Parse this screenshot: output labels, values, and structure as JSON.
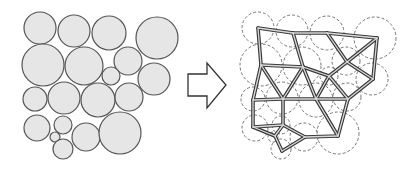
{
  "colors": {
    "background": "#ffffff",
    "circle_fill": "#e6e6e6",
    "circle_stroke": "#555555",
    "dashed_stroke": "#666666",
    "edge_outer": "#3a3a3a",
    "edge_inner": "#d8d8d8",
    "arrow_stroke": "#333333",
    "arrow_fill": "#ffffff"
  },
  "left_panel": {
    "label": "circle-packing",
    "circles": [
      {
        "cx": 40,
        "cy": 28,
        "r": 16
      },
      {
        "cx": 74,
        "cy": 31,
        "r": 16
      },
      {
        "cx": 109,
        "cy": 33,
        "r": 17
      },
      {
        "cx": 157,
        "cy": 38,
        "r": 21
      },
      {
        "cx": 43,
        "cy": 65,
        "r": 21
      },
      {
        "cx": 84,
        "cy": 66,
        "r": 19
      },
      {
        "cx": 128,
        "cy": 61,
        "r": 14
      },
      {
        "cx": 111,
        "cy": 76,
        "r": 9
      },
      {
        "cx": 154,
        "cy": 79,
        "r": 16
      },
      {
        "cx": 35,
        "cy": 99,
        "r": 12
      },
      {
        "cx": 64,
        "cy": 98,
        "r": 16
      },
      {
        "cx": 98,
        "cy": 100,
        "r": 17
      },
      {
        "cx": 129,
        "cy": 97,
        "r": 14
      },
      {
        "cx": 37,
        "cy": 128,
        "r": 13
      },
      {
        "cx": 63,
        "cy": 125,
        "r": 9
      },
      {
        "cx": 55,
        "cy": 137,
        "r": 5
      },
      {
        "cx": 63,
        "cy": 149,
        "r": 10
      },
      {
        "cx": 86,
        "cy": 137,
        "r": 14
      },
      {
        "cx": 120,
        "cy": 133,
        "r": 21
      }
    ]
  },
  "arrow": {
    "label": "transform-arrow",
    "points": "188,74 207,74 207,63 226,85 207,108 207,96 188,96"
  },
  "right_panel": {
    "label": "contact-network",
    "dashed_offset_x": 218,
    "nodes": {
      "A": [
        258,
        28
      ],
      "B": [
        293,
        33
      ],
      "C": [
        327,
        33
      ],
      "D": [
        377,
        38
      ],
      "E": [
        261,
        65
      ],
      "F": [
        303,
        67
      ],
      "G": [
        347,
        62
      ],
      "H": [
        329,
        76
      ],
      "I": [
        373,
        79
      ],
      "J": [
        253,
        100
      ],
      "K": [
        283,
        99
      ],
      "L": [
        316,
        99
      ],
      "M": [
        348,
        99
      ],
      "N": [
        253,
        127
      ],
      "O": [
        283,
        125
      ],
      "P": [
        275,
        136
      ],
      "Q": [
        282,
        151
      ],
      "R": [
        305,
        137
      ],
      "S": [
        338,
        136
      ]
    },
    "edges": [
      [
        "A",
        "B"
      ],
      [
        "B",
        "C"
      ],
      [
        "C",
        "D"
      ],
      [
        "A",
        "E"
      ],
      [
        "B",
        "F"
      ],
      [
        "C",
        "G"
      ],
      [
        "D",
        "G"
      ],
      [
        "D",
        "I"
      ],
      [
        "E",
        "F"
      ],
      [
        "F",
        "H"
      ],
      [
        "G",
        "H"
      ],
      [
        "G",
        "I"
      ],
      [
        "H",
        "L"
      ],
      [
        "H",
        "M"
      ],
      [
        "I",
        "M"
      ],
      [
        "E",
        "J"
      ],
      [
        "E",
        "K"
      ],
      [
        "F",
        "K"
      ],
      [
        "F",
        "L"
      ],
      [
        "J",
        "K"
      ],
      [
        "K",
        "L"
      ],
      [
        "L",
        "M"
      ],
      [
        "J",
        "N"
      ],
      [
        "K",
        "O"
      ],
      [
        "L",
        "S"
      ],
      [
        "M",
        "S"
      ],
      [
        "N",
        "O"
      ],
      [
        "N",
        "P"
      ],
      [
        "O",
        "P"
      ],
      [
        "O",
        "R"
      ],
      [
        "P",
        "Q"
      ],
      [
        "Q",
        "R"
      ],
      [
        "R",
        "S"
      ]
    ]
  }
}
